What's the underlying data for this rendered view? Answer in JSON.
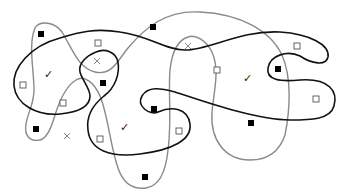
{
  "diagram": {
    "colors": {
      "black_curve": "#111111",
      "gray_curve": "#8a8a8a",
      "filled_square": "#000000",
      "open_square_stroke": "#555555",
      "cross": "#888888",
      "check": "#222222"
    },
    "symbols": {
      "filled_squares": [
        {
          "x": 41,
          "y": 34
        },
        {
          "x": 103,
          "y": 83
        },
        {
          "x": 153,
          "y": 27
        },
        {
          "x": 278,
          "y": 69
        },
        {
          "x": 154,
          "y": 109
        },
        {
          "x": 36,
          "y": 129
        },
        {
          "x": 251,
          "y": 123
        },
        {
          "x": 145,
          "y": 177
        }
      ],
      "open_squares": [
        {
          "x": 98,
          "y": 43
        },
        {
          "x": 23,
          "y": 85
        },
        {
          "x": 63,
          "y": 103
        },
        {
          "x": 217,
          "y": 70
        },
        {
          "x": 297,
          "y": 46
        },
        {
          "x": 316,
          "y": 99
        },
        {
          "x": 179,
          "y": 131
        },
        {
          "x": 100,
          "y": 139
        }
      ],
      "crosses": [
        {
          "x": 97,
          "y": 61
        },
        {
          "x": 188,
          "y": 46
        },
        {
          "x": 67,
          "y": 136
        }
      ],
      "checks": [
        {
          "x": 49,
          "y": 73,
          "glyph": "✓"
        },
        {
          "x": 248,
          "y": 77,
          "glyph": "✓"
        },
        {
          "x": 125,
          "y": 126,
          "glyph": "✓"
        }
      ]
    }
  }
}
